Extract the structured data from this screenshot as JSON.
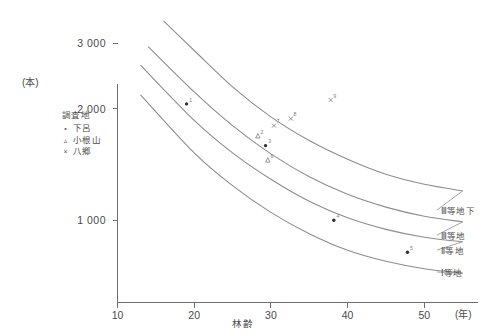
{
  "chart_data": {
    "type": "scatter",
    "title": "",
    "xlabel": "林齢",
    "ylabel": "",
    "x_unit": "(年)",
    "y_unit": "(本)",
    "xlim": [
      10,
      57
    ],
    "ylim": [
      600,
      3600
    ],
    "y_scale": "log",
    "grid": false,
    "legend_position": "inside-upper-left",
    "xticks": [
      "10",
      "20",
      "30",
      "40",
      "50"
    ],
    "xtick_values": [
      10,
      20,
      30,
      40,
      50
    ],
    "yticks": [
      "3 000",
      "2 000",
      "1 000"
    ],
    "ytick_values": [
      3000,
      2000,
      1000
    ],
    "curves": [
      {
        "name": "III等地下",
        "label": "Ⅲ等地下",
        "points": [
          {
            "x": 16,
            "y": 3450
          },
          {
            "x": 20,
            "y": 2870
          },
          {
            "x": 25,
            "y": 2290
          },
          {
            "x": 30,
            "y": 1900
          },
          {
            "x": 35,
            "y": 1640
          },
          {
            "x": 40,
            "y": 1460
          },
          {
            "x": 45,
            "y": 1330
          },
          {
            "x": 50,
            "y": 1250
          },
          {
            "x": 55,
            "y": 1200
          }
        ]
      },
      {
        "name": "III等地",
        "label": "Ⅲ等地",
        "points": [
          {
            "x": 14,
            "y": 2940
          },
          {
            "x": 20,
            "y": 2220
          },
          {
            "x": 25,
            "y": 1800
          },
          {
            "x": 30,
            "y": 1510
          },
          {
            "x": 35,
            "y": 1310
          },
          {
            "x": 40,
            "y": 1175
          },
          {
            "x": 45,
            "y": 1085
          },
          {
            "x": 50,
            "y": 1025
          },
          {
            "x": 55,
            "y": 990
          }
        ]
      },
      {
        "name": "II等地",
        "label": "Ⅱ等地",
        "points": [
          {
            "x": 13,
            "y": 2620
          },
          {
            "x": 20,
            "y": 1860
          },
          {
            "x": 25,
            "y": 1520
          },
          {
            "x": 30,
            "y": 1290
          },
          {
            "x": 35,
            "y": 1125
          },
          {
            "x": 40,
            "y": 1015
          },
          {
            "x": 45,
            "y": 945
          },
          {
            "x": 50,
            "y": 900
          },
          {
            "x": 55,
            "y": 875
          }
        ]
      },
      {
        "name": "I等地",
        "label": "Ⅰ等地",
        "points": [
          {
            "x": 13,
            "y": 2180
          },
          {
            "x": 20,
            "y": 1520
          },
          {
            "x": 25,
            "y": 1240
          },
          {
            "x": 30,
            "y": 1050
          },
          {
            "x": 35,
            "y": 920
          },
          {
            "x": 40,
            "y": 830
          },
          {
            "x": 45,
            "y": 775
          },
          {
            "x": 50,
            "y": 740
          },
          {
            "x": 55,
            "y": 720
          }
        ]
      }
    ],
    "series": [
      {
        "name": "下呂",
        "marker": "dot",
        "points": [
          {
            "x": 19.0,
            "y": 2060,
            "tag": "1"
          },
          {
            "x": 29.3,
            "y": 1590,
            "tag": "3"
          },
          {
            "x": 38.2,
            "y": 1000,
            "tag": "4"
          },
          {
            "x": 47.8,
            "y": 820,
            "tag": "5"
          }
        ]
      },
      {
        "name": "小根山",
        "marker": "triangle",
        "points": [
          {
            "x": 28.3,
            "y": 1690,
            "tag": "2"
          },
          {
            "x": 29.6,
            "y": 1455,
            "tag": "6"
          }
        ]
      },
      {
        "name": "八郷",
        "marker": "cross",
        "points": [
          {
            "x": 30.4,
            "y": 1800,
            "tag": "7"
          },
          {
            "x": 32.6,
            "y": 1880,
            "tag": "8"
          },
          {
            "x": 37.8,
            "y": 2110,
            "tag": "9"
          }
        ]
      }
    ]
  },
  "legend": {
    "title": "調査地",
    "items": [
      {
        "marker": "•",
        "label": "下呂"
      },
      {
        "marker": "▵",
        "label": "小根山"
      },
      {
        "marker": "×",
        "label": "八郷"
      }
    ]
  },
  "axes": {
    "y_unit": "(本)",
    "x_unit": "(年)",
    "x_title": "林齢"
  }
}
